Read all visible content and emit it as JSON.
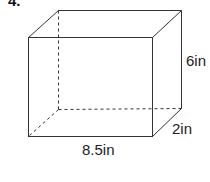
{
  "problem_number": "4.",
  "shape": "rectangular prism",
  "dimensions": {
    "height": "6in",
    "depth": "2in",
    "width": "8.5in"
  },
  "colors": {
    "line": "#333333",
    "background": "#ffffff"
  }
}
